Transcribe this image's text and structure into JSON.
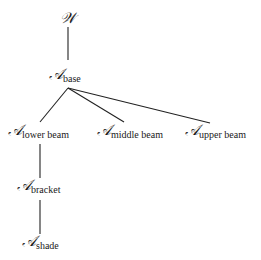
{
  "diagram": {
    "type": "tree",
    "nodes": [
      {
        "id": "W",
        "symbol": "𝒲",
        "subscript": "",
        "x": 68,
        "y": 20
      },
      {
        "id": "base",
        "symbol": "𝒜",
        "subscript": "base",
        "x": 68,
        "y": 77
      },
      {
        "id": "lower_beam",
        "symbol": "𝒜",
        "subscript": "lower beam",
        "x": 40,
        "y": 133
      },
      {
        "id": "middle_beam",
        "symbol": "𝒜",
        "subscript": "middle beam",
        "x": 130,
        "y": 133
      },
      {
        "id": "upper_beam",
        "symbol": "𝒜",
        "subscript": "upper beam",
        "x": 217,
        "y": 133
      },
      {
        "id": "bracket",
        "symbol": "𝒜",
        "subscript": "bracket",
        "x": 40,
        "y": 188
      },
      {
        "id": "shade",
        "symbol": "𝒜",
        "subscript": "shade",
        "x": 40,
        "y": 244
      }
    ],
    "edges": [
      {
        "from": "W",
        "to": "base"
      },
      {
        "from": "base",
        "to": "lower_beam"
      },
      {
        "from": "base",
        "to": "middle_beam"
      },
      {
        "from": "base",
        "to": "upper_beam"
      },
      {
        "from": "lower_beam",
        "to": "bracket"
      },
      {
        "from": "bracket",
        "to": "shade"
      }
    ],
    "colors": {
      "line": "#222222",
      "text": "#1a1a1a",
      "background": "#ffffff"
    }
  }
}
